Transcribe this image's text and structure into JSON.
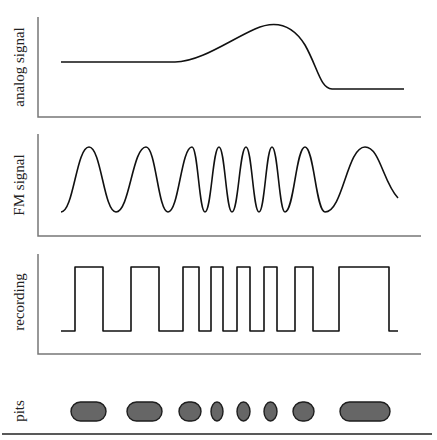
{
  "diagram": {
    "colors": {
      "axis": "#777777",
      "trace": "#111111",
      "pit_fill": "#666666",
      "pit_border": "#1e1e1e",
      "background": "#ffffff"
    },
    "panels": [
      {
        "id": "analog",
        "label": "analog signal",
        "axis": {
          "x": 38,
          "top": 17,
          "bottom": 117,
          "right": 421
        },
        "path": "M61,62 L175,62 C200,62 230,40 255,29 C275,20 292,24 305,45 C318,68 320,88 332,89 L404,89"
      },
      {
        "id": "fm",
        "label": "FM signal",
        "axis": {
          "x": 38,
          "top": 134,
          "bottom": 236,
          "right": 421
        },
        "peaks_x": [
          89,
          146,
          192,
          219,
          246,
          272,
          305,
          365
        ],
        "troughs_x": [
          116,
          168,
          205,
          232,
          259,
          285,
          325
        ],
        "start": {
          "x": 61,
          "y": 212
        },
        "end": {
          "x": 398,
          "y": 198
        },
        "y_high": 147,
        "y_low": 212
      },
      {
        "id": "recording",
        "label": "recording",
        "axis": {
          "x": 38,
          "top": 254,
          "bottom": 354,
          "right": 421
        },
        "y_high": 267,
        "y_low": 331,
        "start_x": 61,
        "transitions_x": [
          75,
          103,
          131,
          159,
          183,
          199,
          211,
          223,
          237,
          250,
          264,
          277,
          295,
          313,
          339,
          389
        ],
        "end_x": 398
      }
    ],
    "pits_row": {
      "label": "pits",
      "baseline": {
        "x1": 2,
        "x2": 432,
        "y": 434
      },
      "pit_top": 402,
      "pit_bottom": 421,
      "pits": [
        {
          "x1": 71,
          "x2": 106
        },
        {
          "x1": 127,
          "x2": 162
        },
        {
          "x1": 179,
          "x2": 201
        },
        {
          "x1": 211,
          "x2": 223
        },
        {
          "x1": 237,
          "x2": 250
        },
        {
          "x1": 264,
          "x2": 277
        },
        {
          "x1": 293,
          "x2": 314
        },
        {
          "x1": 340,
          "x2": 390
        }
      ]
    }
  }
}
